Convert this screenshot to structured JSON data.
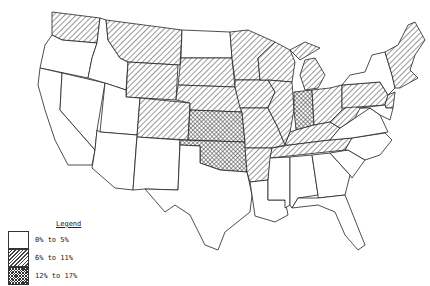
{
  "map": {
    "title": "",
    "region": "Contiguous United States",
    "legend": {
      "title": "Legend",
      "items": [
        {
          "label": "0% to 5%",
          "pattern": "none"
        },
        {
          "label": "6% to 11%",
          "pattern": "diagonal-hatch"
        },
        {
          "label": "12% to 17%",
          "pattern": "cross-hatch"
        }
      ]
    },
    "states": {
      "0% to 5%": [
        "CA",
        "OR",
        "NV",
        "ID",
        "UT",
        "AZ",
        "NM",
        "TX",
        "ND",
        "LA",
        "MS",
        "AL",
        "GA",
        "FL",
        "SC",
        "NC",
        "VA",
        "NY",
        "MD",
        "DE"
      ],
      "6% to 11%": [
        "WA",
        "MT",
        "WY",
        "CO",
        "SD",
        "NE",
        "MN",
        "IA",
        "WI",
        "IL",
        "MI",
        "MO",
        "AR",
        "OH",
        "KY",
        "TN",
        "WV",
        "PA",
        "NJ",
        "ME",
        "NH",
        "VT",
        "MA",
        "CT",
        "RI"
      ],
      "12% to 17%": [
        "KS",
        "OK",
        "IN"
      ]
    }
  }
}
